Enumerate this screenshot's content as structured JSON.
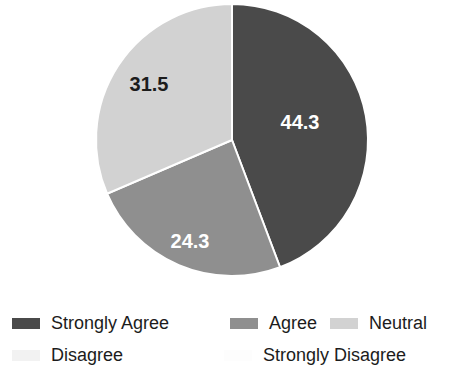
{
  "chart_data": {
    "type": "pie",
    "title": "",
    "labels": [
      "Strongly Agree",
      "Agree",
      "Neutral",
      "Disagree",
      "Strongly Disagree"
    ],
    "values": [
      44.3,
      24.3,
      31.5,
      0,
      0
    ],
    "value_labels": [
      "44.3",
      "24.3",
      "31.5",
      "",
      ""
    ],
    "colors": [
      "#4a4a4a",
      "#8f8f8f",
      "#d2d2d2",
      "#f2f2f2",
      "#fafafa"
    ],
    "label_text_colors": [
      "#ffffff",
      "#ffffff",
      "#1c1c1c",
      "#1c1c1c",
      "#1c1c1c"
    ],
    "units": "percent",
    "start_angle_deg": 0,
    "direction": "clockwise",
    "legend_position": "bottom",
    "grid": false,
    "visible_slices": 3
  },
  "pie": {
    "center_x": 232,
    "center_y": 140,
    "radius": 136,
    "slices": [
      {
        "name": "Strongly Agree",
        "value": 44.3,
        "label": "44.3",
        "color": "#4a4a4a",
        "label_color": "#ffffff",
        "label_x": 300,
        "label_y": 124
      },
      {
        "name": "Agree",
        "value": 24.3,
        "label": "24.3",
        "color": "#8f8f8f",
        "label_color": "#ffffff",
        "label_x": 190,
        "label_y": 243
      },
      {
        "name": "Neutral",
        "value": 31.5,
        "label": "31.5",
        "color": "#d2d2d2",
        "label_color": "#1c1c1c",
        "label_x": 149,
        "label_y": 86
      },
      {
        "name": "Disagree",
        "value": 0,
        "label": "",
        "color": "#f2f2f2",
        "label_color": "#1c1c1c",
        "label_x": 0,
        "label_y": 0
      },
      {
        "name": "Strongly Disagree",
        "value": 0,
        "label": "",
        "color": "#fafafa",
        "label_color": "#1c1c1c",
        "label_x": 0,
        "label_y": 0
      }
    ]
  },
  "legend": {
    "row1": [
      {
        "label": "Strongly Agree",
        "color": "#4a4a4a"
      },
      {
        "label": "Agree",
        "color": "#8f8f8f"
      },
      {
        "label": "Neutral",
        "color": "#d2d2d2"
      }
    ],
    "row2": [
      {
        "label": "Disagree",
        "color": "#f2f2f2"
      },
      {
        "label": "Strongly Disagree",
        "color": "#fdfdfd"
      }
    ]
  }
}
